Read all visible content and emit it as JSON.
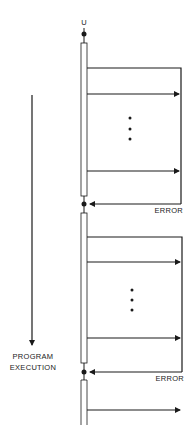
{
  "diagram": {
    "top_label": "U",
    "side_label_line1": "PROGRAM",
    "side_label_line2": "EXECUTION",
    "error_label": "ERROR",
    "blocks": [
      {
        "has_error_return": true,
        "has_ellipsis": true
      },
      {
        "has_error_return": true,
        "has_ellipsis": true
      },
      {
        "has_error_return": false,
        "has_ellipsis": false
      }
    ]
  }
}
